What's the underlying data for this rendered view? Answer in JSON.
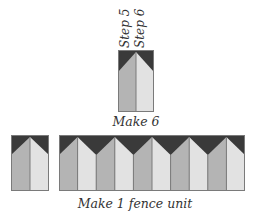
{
  "labels": {
    "step_a": "Step 5",
    "step_b": "Step 6",
    "make_6": "Make 6",
    "make_fence": "Make 1 fence unit"
  },
  "colors": {
    "dark": "#3a3a3a",
    "left_panel": "#b4b4b4",
    "right_panel": "#e2e2e2",
    "outline": "#7a7a7a",
    "background": "#ffffff"
  },
  "diagram": {
    "single_unit": {
      "count_label": "Make 6"
    },
    "fence_unit": {
      "loose_blocks": 1,
      "joined_blocks": 5,
      "count_label": "Make 1 fence unit"
    }
  }
}
